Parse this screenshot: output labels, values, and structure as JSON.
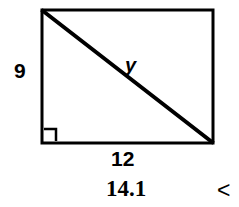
{
  "figure": {
    "stroke_color": "#000000",
    "background_color": "#ffffff",
    "labels": {
      "vertical_leg": "9",
      "horizontal_leg": "12",
      "hypotenuse": "y",
      "right_angle_marker": "right-angle"
    },
    "answer": {
      "value": "14.1",
      "marker": "<"
    },
    "geometry": {
      "rect_left": 42,
      "rect_top": 10,
      "rect_right": 213,
      "rect_bottom": 143,
      "rect_width": 171,
      "rect_height": 133,
      "diagonal_from": "top-left",
      "diagonal_to": "bottom-right",
      "right_angle_square_size": 13,
      "stroke_width_rect": 3,
      "stroke_width_diagonal": 4
    }
  }
}
